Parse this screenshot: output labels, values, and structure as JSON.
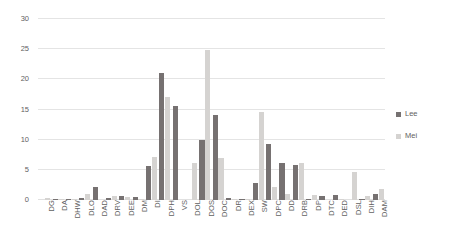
{
  "chart_data": {
    "type": "bar",
    "title": "",
    "subtitle": "",
    "xlabel": "",
    "ylabel": "",
    "ylim": [
      0,
      30
    ],
    "ytick_labels": [
      "0",
      "5",
      "10",
      "15",
      "20",
      "25",
      "30"
    ],
    "ytick_values": [
      0,
      5,
      10,
      15,
      20,
      25,
      30
    ],
    "grid": true,
    "legend_position": "right",
    "categories": [
      "DG",
      "DA",
      "DHW",
      "DLO",
      "DAD",
      "DRV",
      "DEE",
      "DM",
      "DI",
      "DPH",
      "VS",
      "DOL",
      "DOS",
      "DOC",
      "DR",
      "DEX",
      "SW",
      "DPC",
      "DD",
      "DRB",
      "DP",
      "DTC",
      "DED",
      "DSL",
      "DIH",
      "DAM"
    ],
    "series": [
      {
        "name": "Lee",
        "color": "#767171",
        "values": [
          0.0,
          0.2,
          0.1,
          0.3,
          2.1,
          0.4,
          0.6,
          0.5,
          5.7,
          21.0,
          15.6,
          0.0,
          10.0,
          14.1,
          0.4,
          0.2,
          2.8,
          9.3,
          6.1,
          5.8,
          0.2,
          0.6,
          0.8,
          0.0,
          0.1,
          1.0
        ]
      },
      {
        "name": "Mei",
        "color": "#d5d3d1",
        "values": [
          0.4,
          0.1,
          0.1,
          1.0,
          0.0,
          0.6,
          0.5,
          0.1,
          7.2,
          17.1,
          0.0,
          6.1,
          24.9,
          6.9,
          0.2,
          0.1,
          14.6,
          2.1,
          1.0,
          6.2,
          0.8,
          0.0,
          0.2,
          4.6,
          0.7,
          1.8
        ]
      }
    ]
  },
  "legend": {
    "items": [
      {
        "label": "Lee",
        "color": "#767171"
      },
      {
        "label": "Mei",
        "color": "#d5d3d1"
      }
    ]
  }
}
